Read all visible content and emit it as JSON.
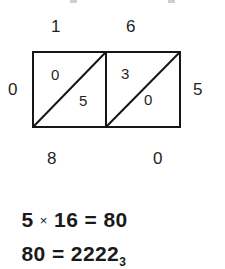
{
  "figure": {
    "type": "lattice-multiplication"
  },
  "lattice": {
    "columns": 2,
    "rows": 1,
    "top_labels": [
      "1",
      "6"
    ],
    "left_label": "0",
    "right_label": "5",
    "bottom_labels": [
      "8",
      "0"
    ],
    "cells": [
      {
        "index": 0,
        "upper": "0",
        "lower": "5"
      },
      {
        "index": 1,
        "upper": "3",
        "lower": "0"
      }
    ],
    "diagonal_direction": "bottom-left-to-top-right",
    "stroke_color": "#161616",
    "stroke_width": 2
  },
  "equations": {
    "product": {
      "left": "5",
      "operator": "×",
      "right": "16",
      "equals": "=",
      "result": "80",
      "full_text": "5 × 16 = 80"
    },
    "base_conversion": {
      "left": "80",
      "equals": "=",
      "digits": "2222",
      "subscript": "3",
      "full_text": "80 = 2222₃"
    }
  },
  "colors": {
    "background": "#ffffff",
    "ink": "#1a1a1a",
    "clipped_mark": "#cfcfcf"
  }
}
